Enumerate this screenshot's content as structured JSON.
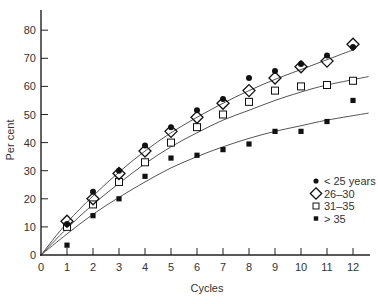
{
  "chart_data": {
    "type": "scatter",
    "title": "",
    "xlabel": "Cycles",
    "ylabel": "Per cent",
    "xlim": [
      0,
      12.6
    ],
    "ylim": [
      0,
      88
    ],
    "x_ticks": [
      0,
      1,
      2,
      3,
      4,
      5,
      6,
      7,
      8,
      9,
      10,
      11,
      12
    ],
    "y_ticks": [
      0,
      10,
      20,
      30,
      40,
      50,
      60,
      70,
      80
    ],
    "grid": false,
    "legend_position": "lower right (inside)",
    "x": [
      1,
      2,
      3,
      4,
      5,
      6,
      7,
      8,
      9,
      10,
      11,
      12
    ],
    "series": [
      {
        "name": "< 25 years",
        "marker": "filled-circle",
        "values": [
          11,
          22.5,
          30,
          39,
          45.5,
          51.5,
          55.5,
          63,
          65.5,
          68,
          71,
          74
        ]
      },
      {
        "name": "26–30",
        "marker": "open-diamond",
        "values": [
          12,
          20,
          29,
          37,
          44,
          49,
          54,
          58.5,
          63,
          67,
          69,
          75
        ]
      },
      {
        "name": "31–35",
        "marker": "open-square",
        "values": [
          10,
          18,
          26,
          33,
          40,
          45.5,
          50,
          54.5,
          58.5,
          60,
          60.5,
          62
        ]
      },
      {
        "name": "> 35",
        "marker": "filled-square",
        "values": [
          3.5,
          14,
          20,
          28,
          34.5,
          35.5,
          37.5,
          39.5,
          44,
          44,
          47.5,
          55
        ]
      }
    ],
    "fitted_curves": [
      {
        "name": "upper fit (< 25 years & 26–30)",
        "x": [
          0,
          1,
          2,
          3,
          4,
          5,
          6,
          7,
          8,
          9,
          10,
          11,
          12
        ],
        "y": [
          0,
          11.5,
          21,
          29.5,
          37,
          43.5,
          49,
          54,
          58.5,
          62.5,
          66,
          69.5,
          73
        ]
      },
      {
        "name": "31–35 fit",
        "x": [
          0,
          1,
          2,
          3,
          4,
          5,
          6,
          7,
          8,
          9,
          10,
          11,
          12.6
        ],
        "y": [
          0,
          9.5,
          18,
          25.5,
          32.5,
          38.5,
          43.5,
          48,
          51.5,
          55,
          58,
          60.5,
          63.5
        ]
      },
      {
        "name": "> 35 fit",
        "x": [
          0,
          1,
          2,
          3,
          4,
          5,
          6,
          7,
          8,
          9,
          10,
          11,
          12.6
        ],
        "y": [
          0,
          7.5,
          14.5,
          20.5,
          26,
          31,
          35,
          38.5,
          41.5,
          44,
          46,
          48,
          50.5
        ]
      }
    ]
  },
  "axes": {
    "x_title": "Cycles",
    "y_title": "Per cent"
  },
  "legend": {
    "items": [
      {
        "label": "< 25 years",
        "marker": "filled-circle"
      },
      {
        "label": "26–30",
        "marker": "open-diamond"
      },
      {
        "label": "31–35",
        "marker": "open-square"
      },
      {
        "label": "> 35",
        "marker": "filled-square"
      }
    ]
  },
  "colors": {
    "axis": "#222222",
    "marker": "#111111",
    "curve": "#555555",
    "text": "#333333"
  }
}
